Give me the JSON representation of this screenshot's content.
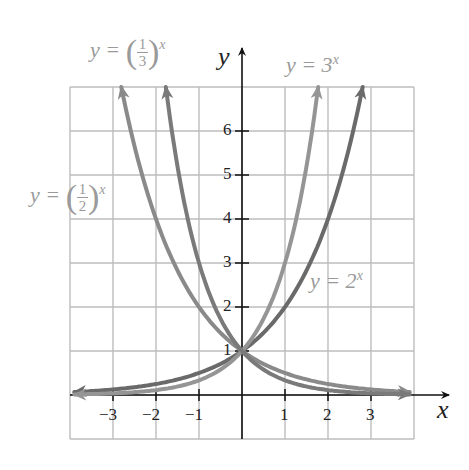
{
  "chart_data": {
    "type": "line",
    "title": "",
    "xlabel": "x",
    "ylabel": "y",
    "xlim": [
      -4,
      4
    ],
    "ylim": [
      -1,
      7
    ],
    "grid": true,
    "x_ticks": [
      "-3",
      "-2",
      "-1",
      "1",
      "2",
      "3"
    ],
    "y_ticks": [
      "1",
      "2",
      "3",
      "4",
      "5",
      "6"
    ],
    "series": [
      {
        "name": "y = 2^x",
        "base": 2,
        "color": "#6a6a6a",
        "points": [
          [
            -4,
            0.0625
          ],
          [
            -3,
            0.125
          ],
          [
            -2,
            0.25
          ],
          [
            -1,
            0.5
          ],
          [
            0,
            1
          ],
          [
            1,
            2
          ],
          [
            2,
            4
          ],
          [
            2.81,
            7
          ]
        ]
      },
      {
        "name": "y = 3^x",
        "base": 3,
        "color": "#959595",
        "points": [
          [
            -4,
            0.012
          ],
          [
            -3,
            0.037
          ],
          [
            -2,
            0.111
          ],
          [
            -1,
            0.333
          ],
          [
            0,
            1
          ],
          [
            1,
            3
          ],
          [
            1.77,
            7
          ]
        ]
      },
      {
        "name": "y = (1/2)^x",
        "base": 0.5,
        "color": "#8a8a8a",
        "points": [
          [
            -2.81,
            7
          ],
          [
            -2,
            4
          ],
          [
            -1,
            2
          ],
          [
            0,
            1
          ],
          [
            1,
            0.5
          ],
          [
            2,
            0.25
          ],
          [
            3,
            0.125
          ],
          [
            4,
            0.0625
          ]
        ]
      },
      {
        "name": "y = (1/3)^x",
        "base": 0.3333,
        "color": "#7a7a7a",
        "points": [
          [
            -1.77,
            7
          ],
          [
            -1,
            3
          ],
          [
            0,
            1
          ],
          [
            1,
            0.333
          ],
          [
            2,
            0.111
          ],
          [
            3,
            0.037
          ],
          [
            4,
            0.012
          ]
        ]
      }
    ],
    "annotations": [
      {
        "text": "y = (1/3)^x",
        "position": "top-left"
      },
      {
        "text": "y = 3^x",
        "position": "top-right"
      },
      {
        "text": "y = (1/2)^x",
        "position": "left"
      },
      {
        "text": "y = 2^x",
        "position": "right"
      }
    ]
  },
  "labels": {
    "y_eq": "y =",
    "one": "1",
    "three": "3",
    "two": "2",
    "x": "x",
    "label_3x_base": "y = 3",
    "label_2x_base": "y = 2",
    "axis_x": "x",
    "axis_y": "y"
  }
}
